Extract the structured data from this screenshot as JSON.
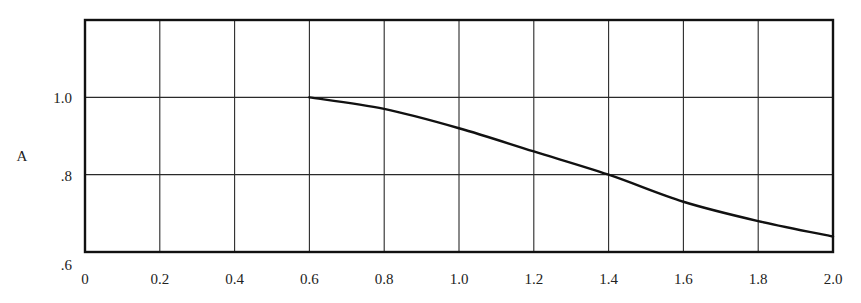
{
  "chart_data": {
    "type": "line",
    "title": "",
    "xlabel": "",
    "ylabel": "A",
    "xlim": [
      0,
      2.0
    ],
    "ylim": [
      0.6,
      1.2
    ],
    "grid": true,
    "legend": null,
    "x_ticks": [
      0,
      0.2,
      0.4,
      0.6,
      0.8,
      1.0,
      1.2,
      1.4,
      1.6,
      1.8,
      2.0
    ],
    "x_tick_labels": [
      "0",
      "0.2",
      "0.4",
      "0.6",
      "0.8",
      "1.0",
      "1.2",
      "1.4",
      "1.6",
      "1.8",
      "2.0"
    ],
    "y_ticks": [
      0.6,
      0.8,
      1.0
    ],
    "y_tick_labels": [
      ".6",
      ".8",
      "1.0"
    ],
    "y_gridlines": [
      0.8,
      1.0
    ],
    "series": [
      {
        "name": "A",
        "x": [
          0.6,
          0.8,
          1.0,
          1.2,
          1.4,
          1.6,
          1.8,
          2.0
        ],
        "values": [
          1.0,
          0.97,
          0.92,
          0.86,
          0.8,
          0.73,
          0.68,
          0.64
        ],
        "color": "#111111"
      }
    ]
  },
  "style": {
    "line_color": "#111111",
    "grid_color": "#2a2a2a",
    "frame_color": "#111111",
    "background": "#ffffff"
  }
}
